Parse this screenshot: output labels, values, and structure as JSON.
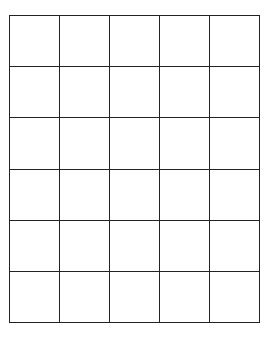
{
  "grid": {
    "rows": 6,
    "columns": 5,
    "line_color": "#222222",
    "background": "#ffffff",
    "cells": [
      [
        "",
        "",
        "",
        "",
        ""
      ],
      [
        "",
        "",
        "",
        "",
        ""
      ],
      [
        "",
        "",
        "",
        "",
        ""
      ],
      [
        "",
        "",
        "",
        "",
        ""
      ],
      [
        "",
        "",
        "",
        "",
        ""
      ],
      [
        "",
        "",
        "",
        "",
        ""
      ]
    ]
  }
}
